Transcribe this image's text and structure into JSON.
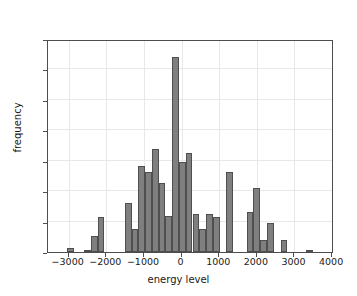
{
  "chart_data": {
    "type": "bar",
    "title": "",
    "xlabel": "energy level",
    "ylabel": "frequency",
    "xlim": [
      -3550,
      4050
    ],
    "ylim": [
      0,
      700
    ],
    "grid": true,
    "legend": null,
    "bin_width": 180,
    "xticks": [
      -3000,
      -2000,
      -1000,
      0,
      1000,
      2000,
      3000,
      4000
    ],
    "xtick_labels": [
      "−3000",
      "−2000",
      "−1000",
      "0",
      "1000",
      "2000",
      "3000",
      "4000"
    ],
    "yticks": [
      0,
      100,
      200,
      300,
      400,
      500,
      600,
      700
    ],
    "ytick_labels": [
      "0",
      "100",
      "200",
      "300",
      "400",
      "500",
      "600",
      "700"
    ],
    "bar_color": "#7f7f7f",
    "bar_edge_color": "#4f4f4f",
    "bins": [
      {
        "center": -2950,
        "left": -3040,
        "right": -2860,
        "value": 13
      },
      {
        "center": -2500,
        "left": -2590,
        "right": -2410,
        "value": 8
      },
      {
        "center": -2320,
        "left": -2410,
        "right": -2230,
        "value": 52
      },
      {
        "center": -2140,
        "left": -2230,
        "right": -2050,
        "value": 114
      },
      {
        "center": -1420,
        "left": -1510,
        "right": -1330,
        "value": 160
      },
      {
        "center": -1240,
        "left": -1330,
        "right": -1150,
        "value": 75
      },
      {
        "center": -1060,
        "left": -1150,
        "right": -970,
        "value": 284
      },
      {
        "center": -880,
        "left": -970,
        "right": -790,
        "value": 262
      },
      {
        "center": -700,
        "left": -790,
        "right": -610,
        "value": 337
      },
      {
        "center": -520,
        "left": -610,
        "right": -430,
        "value": 228
      },
      {
        "center": -340,
        "left": -430,
        "right": -250,
        "value": 120
      },
      {
        "center": -160,
        "left": -250,
        "right": -70,
        "value": 640
      },
      {
        "center": 20,
        "left": -70,
        "right": 110,
        "value": 296
      },
      {
        "center": 200,
        "left": 110,
        "right": 290,
        "value": 327
      },
      {
        "center": 380,
        "left": 290,
        "right": 470,
        "value": 125
      },
      {
        "center": 560,
        "left": 470,
        "right": 650,
        "value": 75
      },
      {
        "center": 740,
        "left": 650,
        "right": 830,
        "value": 124
      },
      {
        "center": 920,
        "left": 830,
        "right": 1010,
        "value": 115
      },
      {
        "center": 1280,
        "left": 1190,
        "right": 1370,
        "value": 263
      },
      {
        "center": 1820,
        "left": 1730,
        "right": 1910,
        "value": 130
      },
      {
        "center": 2000,
        "left": 1910,
        "right": 2090,
        "value": 212
      },
      {
        "center": 2180,
        "left": 2090,
        "right": 2270,
        "value": 40
      },
      {
        "center": 2360,
        "left": 2270,
        "right": 2450,
        "value": 96
      },
      {
        "center": 2720,
        "left": 2630,
        "right": 2810,
        "value": 40
      },
      {
        "center": 3400,
        "left": 3310,
        "right": 3490,
        "value": 8
      }
    ]
  }
}
